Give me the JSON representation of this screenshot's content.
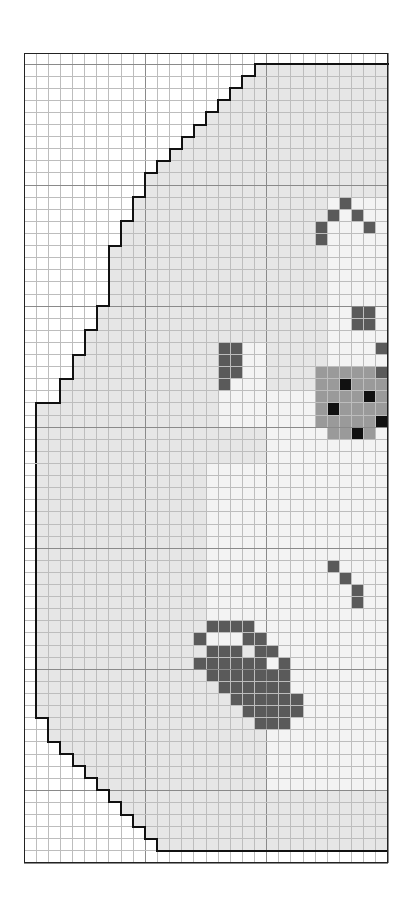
{
  "pattern": {
    "title": "Cross-stitch chart",
    "cols": 30,
    "rows": 67,
    "colors": {
      "empty": "#ffffff",
      "fill": "#e6e6e6",
      "light": "#f3f3f3",
      "mid": "#dcdcdc",
      "gray": "#9a9a9a",
      "dark": "#5a5a5a",
      "black": "#111111"
    },
    "fill_start_by_row": [
      19,
      19,
      18,
      17,
      16,
      15,
      14,
      13,
      12,
      11,
      10,
      10,
      9,
      9,
      8,
      8,
      7,
      7,
      7,
      7,
      7,
      6,
      6,
      5,
      5,
      4,
      4,
      3,
      3,
      1,
      1,
      1,
      1,
      1,
      1,
      1,
      1,
      1,
      1,
      1,
      1,
      1,
      1,
      1,
      1,
      1,
      1,
      1,
      1,
      1,
      1,
      1,
      1,
      1,
      1,
      2,
      2,
      3,
      4,
      5,
      6,
      7,
      8,
      9,
      10,
      11,
      12,
      19
    ],
    "light_regions": [
      {
        "r0": 12,
        "r1": 28,
        "c0": 25,
        "c1": 29
      },
      {
        "r0": 24,
        "r1": 30,
        "c0": 16,
        "c1": 19
      },
      {
        "r0": 28,
        "r1": 60,
        "c0": 20,
        "c1": 29
      },
      {
        "r0": 34,
        "r1": 48,
        "c0": 15,
        "c1": 20
      },
      {
        "r0": 48,
        "r1": 60,
        "c0": 22,
        "c1": 29
      }
    ],
    "dark_cells": [
      [
        12,
        26
      ],
      [
        13,
        25
      ],
      [
        13,
        27
      ],
      [
        14,
        24
      ],
      [
        14,
        28
      ],
      [
        15,
        24
      ],
      [
        21,
        27
      ],
      [
        21,
        28
      ],
      [
        22,
        27
      ],
      [
        22,
        28
      ],
      [
        24,
        29
      ],
      [
        26,
        29
      ],
      [
        24,
        16
      ],
      [
        24,
        17
      ],
      [
        25,
        16
      ],
      [
        25,
        17
      ],
      [
        26,
        16
      ],
      [
        26,
        17
      ],
      [
        27,
        16
      ],
      [
        42,
        25
      ],
      [
        43,
        26
      ],
      [
        44,
        27
      ],
      [
        45,
        27
      ],
      [
        47,
        15
      ],
      [
        47,
        16
      ],
      [
        47,
        17
      ],
      [
        47,
        18
      ],
      [
        48,
        14
      ],
      [
        48,
        18
      ],
      [
        48,
        19
      ],
      [
        49,
        15
      ],
      [
        49,
        16
      ],
      [
        49,
        17
      ],
      [
        49,
        19
      ],
      [
        49,
        20
      ],
      [
        50,
        14
      ],
      [
        50,
        15
      ],
      [
        50,
        16
      ],
      [
        50,
        17
      ],
      [
        50,
        18
      ],
      [
        50,
        19
      ],
      [
        50,
        21
      ],
      [
        51,
        15
      ],
      [
        51,
        16
      ],
      [
        51,
        17
      ],
      [
        51,
        18
      ],
      [
        51,
        19
      ],
      [
        51,
        20
      ],
      [
        51,
        21
      ],
      [
        52,
        16
      ],
      [
        52,
        17
      ],
      [
        52,
        18
      ],
      [
        52,
        19
      ],
      [
        52,
        20
      ],
      [
        52,
        21
      ],
      [
        53,
        17
      ],
      [
        53,
        18
      ],
      [
        53,
        19
      ],
      [
        53,
        20
      ],
      [
        53,
        21
      ],
      [
        53,
        22
      ],
      [
        54,
        18
      ],
      [
        54,
        19
      ],
      [
        54,
        20
      ],
      [
        54,
        21
      ],
      [
        54,
        22
      ],
      [
        55,
        19
      ],
      [
        55,
        20
      ],
      [
        55,
        21
      ]
    ],
    "gray_cells": [
      [
        26,
        24
      ],
      [
        26,
        25
      ],
      [
        26,
        26
      ],
      [
        26,
        27
      ],
      [
        26,
        28
      ],
      [
        27,
        24
      ],
      [
        27,
        25
      ],
      [
        27,
        26
      ],
      [
        27,
        27
      ],
      [
        27,
        28
      ],
      [
        27,
        29
      ],
      [
        28,
        24
      ],
      [
        28,
        25
      ],
      [
        28,
        26
      ],
      [
        28,
        27
      ],
      [
        28,
        28
      ],
      [
        28,
        29
      ],
      [
        29,
        24
      ],
      [
        29,
        25
      ],
      [
        29,
        26
      ],
      [
        29,
        27
      ],
      [
        29,
        28
      ],
      [
        29,
        29
      ],
      [
        30,
        24
      ],
      [
        30,
        25
      ],
      [
        30,
        26
      ],
      [
        30,
        27
      ],
      [
        30,
        28
      ],
      [
        30,
        29
      ],
      [
        31,
        25
      ],
      [
        31,
        26
      ],
      [
        31,
        27
      ],
      [
        31,
        28
      ]
    ],
    "black_cells": [
      [
        27,
        26
      ],
      [
        28,
        28
      ],
      [
        29,
        25
      ],
      [
        30,
        29
      ],
      [
        31,
        27
      ]
    ]
  }
}
